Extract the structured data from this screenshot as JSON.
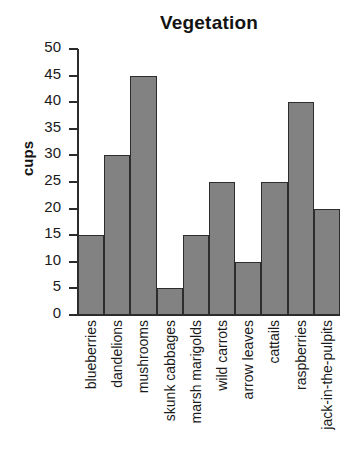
{
  "chart_data": {
    "type": "bar",
    "title": "Vegetation",
    "xlabel": "",
    "ylabel": "cups",
    "ylim": [
      0,
      50
    ],
    "ytick_step": 5,
    "yticks": [
      50,
      45,
      40,
      35,
      30,
      25,
      20,
      15,
      10,
      5,
      0
    ],
    "grid": false,
    "legend": null,
    "categories": [
      "blueberries",
      "dandelions",
      "mushrooms",
      "skunk cabbages",
      "marsh marigolds",
      "wild carrots",
      "arrow leaves",
      "cattails",
      "raspberries",
      "jack-in-the-pulpits"
    ],
    "values": [
      15,
      30,
      45,
      5,
      15,
      25,
      10,
      25,
      40,
      20
    ],
    "bar_color": "#828282",
    "bar_edge_color": "#2d2d2d",
    "axis_color": "#2b2b2b",
    "background": "#ffffff"
  }
}
